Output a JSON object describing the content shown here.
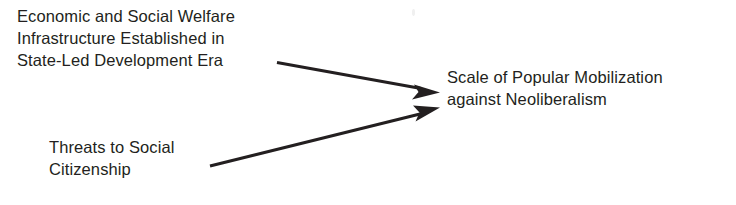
{
  "diagram": {
    "type": "causal-flow",
    "background_color": "#ffffff",
    "text_color": "#231f20",
    "arrow_color": "#231f20",
    "nodes": [
      {
        "id": "welfare-infrastructure",
        "role": "cause",
        "lines": [
          "Economic and Social Welfare",
          "Infrastructure Established in",
          "State-Led Development Era"
        ]
      },
      {
        "id": "threats-citizenship",
        "role": "cause",
        "lines": [
          "Threats to Social",
          "Citizenship"
        ]
      },
      {
        "id": "popular-mobilization",
        "role": "effect",
        "lines": [
          "Scale of Popular Mobilization",
          "against Neoliberalism"
        ]
      }
    ],
    "edges": [
      {
        "id": "edge-welfare-to-mobilization",
        "from": "welfare-infrastructure",
        "to": "popular-mobilization",
        "style": "solid-arrow"
      },
      {
        "id": "edge-threats-to-mobilization",
        "from": "threats-citizenship",
        "to": "popular-mobilization",
        "style": "solid-arrow"
      }
    ]
  }
}
